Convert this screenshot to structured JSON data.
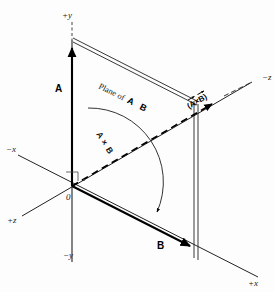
{
  "figure": {
    "background_color": "#fdfdfd",
    "ink_color": "#000000"
  },
  "axes": {
    "y_positive": "+y",
    "y_negative": "−y",
    "x_positive": "+x",
    "x_negative": "−x",
    "z_positive": "+z",
    "z_negative": "−z",
    "origin": "0"
  },
  "vectors": {
    "a_label": "A",
    "b_label": "B",
    "cross_label": "(A×B)"
  },
  "annotations": {
    "plane_text": "Plane of",
    "plane_vector_a": "A",
    "plane_vector_b": "B",
    "arc_label_a": "A",
    "arc_label_times": "×",
    "arc_label_b": "B"
  }
}
